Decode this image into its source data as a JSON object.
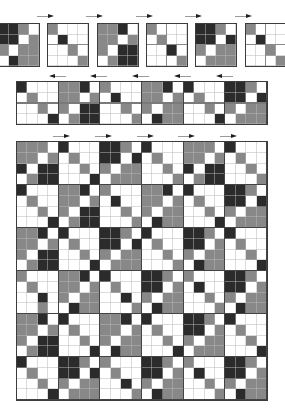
{
  "palette": {
    "0": "#ffffff",
    "1": "#888888",
    "2": "#2b2b2b"
  },
  "legend": {
    "0": "white",
    "1": "gray",
    "2": "black"
  },
  "top_row": {
    "arrow_direction": "right",
    "tiles": [
      [
        "2210",
        "2201",
        "1011",
        "0211"
      ],
      [
        "1000",
        "0200",
        "0010",
        "0001"
      ],
      [
        "1120",
        "1101",
        "1022",
        "0122"
      ],
      [
        "1000",
        "0100",
        "0020",
        "0001"
      ],
      [
        "2210",
        "2202",
        "1011",
        "0111"
      ],
      [
        "1000",
        "0200",
        "0010",
        "0001"
      ]
    ]
  },
  "strip": {
    "arrow_direction": "left",
    "rows": [
      "200011201000112020002210",
      "010011010200110101002202",
      "001010220010101100101011",
      "000201220001021100020111"
    ]
  },
  "big_grid": {
    "arrow_direction": "right",
    "rows": [
      "111020002210200011102000",
      "110101002202010011010100",
      "202200101011001020220010",
      "012200020111000101220001",
      "200011201000112020002210",
      "010011010200110101002202",
      "001010220010101100101011",
      "000201220001021100020111",
      "112020002210200022102000",
      "110101002202010022010100",
      "102200101011001010110010",
      "012200020111000102110002",
      "100011202000221010002210",
      "010011010100220102002201",
      "002010110020101100101011",
      "001002110001021100010211",
      "112020001120200022102000",
      "110101001101010022010100",
      "102200101011001010110010",
      "012200020211000201110002",
      "200022101000221010002210",
      "010022020100220102002201",
      "001010110020101100101011",
      "000201110001021100010211"
    ]
  }
}
